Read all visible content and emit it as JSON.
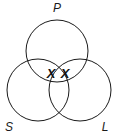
{
  "diagram": {
    "type": "venn",
    "sets": [
      {
        "label": "P",
        "cx": 57,
        "cy": 51,
        "r": 31,
        "label_x": 57,
        "label_y": 12
      },
      {
        "label": "S",
        "cx": 38,
        "cy": 90,
        "r": 31,
        "label_x": 9,
        "label_y": 131
      },
      {
        "label": "L",
        "cx": 80,
        "cy": 90,
        "r": 31,
        "label_x": 105,
        "label_y": 131
      }
    ],
    "marks": [
      {
        "text": "X",
        "x": 51,
        "y": 78
      },
      {
        "text": "X",
        "x": 65,
        "y": 78
      }
    ],
    "stroke_color": "#1a1a1a"
  }
}
